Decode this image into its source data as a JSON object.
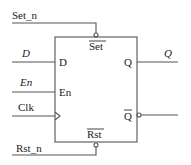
{
  "diagram": {
    "type": "d-flip-flop-with-enable",
    "inputs": {
      "set": "Set_n",
      "data": "D",
      "enable": "En",
      "clock": "Clk",
      "reset": "Rst_n"
    },
    "outputs": {
      "q": "Q"
    },
    "block": {
      "pin_set": "Set",
      "pin_d": "D",
      "pin_en": "En",
      "pin_q": "Q",
      "pin_qbar": "Q",
      "pin_rst": "Rst"
    },
    "colors": {
      "line": "#555555",
      "text": "#222222",
      "background": "#ffffff"
    }
  }
}
